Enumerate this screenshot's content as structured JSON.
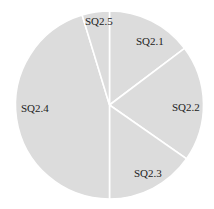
{
  "chart_data": {
    "type": "pie",
    "title": "",
    "categories": [
      "SQ2.1",
      "SQ2.2",
      "SQ2.3",
      "SQ2.4",
      "SQ2.5"
    ],
    "values": [
      14.7,
      20.0,
      15.3,
      45.3,
      4.7
    ],
    "units": "percent (estimated from slice angles)",
    "start_angle_deg": 0,
    "direction": "clockwise",
    "legend": "none (labels inside slices)",
    "fill_color": "#dcdcdc",
    "separator_color": "#ffffff",
    "label_color": "#222222"
  },
  "labels": {
    "s1": "SQ2.1",
    "s2": "SQ2.2",
    "s3": "SQ2.3",
    "s4": "SQ2.4",
    "s5": "SQ2.5"
  }
}
